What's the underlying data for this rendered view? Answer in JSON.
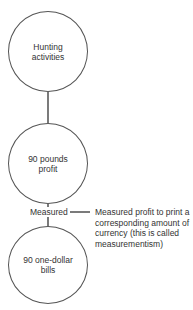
{
  "diagram": {
    "nodes": [
      {
        "id": "hunting",
        "label": "Hunting activities"
      },
      {
        "id": "profit",
        "label": "90 pounds profit"
      },
      {
        "id": "bills",
        "label": "90 one-dollar bills"
      }
    ],
    "edge_label": "Measured",
    "annotation": "Measured profit to print a corresponding amount of currency (this is called measurementism)",
    "colors": {
      "stroke": "#555555",
      "text": "#333333",
      "background": "#ffffff"
    }
  }
}
